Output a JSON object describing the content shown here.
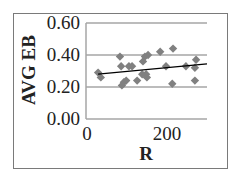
{
  "chart_data": {
    "type": "scatter",
    "title": "",
    "xlabel": "R",
    "ylabel": "AVG EB",
    "xlim": [
      0,
      310
    ],
    "ylim": [
      0.0,
      0.6
    ],
    "x_ticks": [
      0,
      200
    ],
    "x_tick_labels": [
      "0",
      "200"
    ],
    "y_ticks": [
      0.0,
      0.2,
      0.4,
      0.6
    ],
    "y_tick_labels": [
      "0.00",
      "0.20",
      "0.40",
      "0.60"
    ],
    "grid": {
      "horizontal": true,
      "vertical": false
    },
    "legend": null,
    "series": [
      {
        "name": "AVG EB",
        "marker": "diamond",
        "color": "#808080",
        "points": [
          {
            "x": 31,
            "y": 0.29
          },
          {
            "x": 38,
            "y": 0.26
          },
          {
            "x": 87,
            "y": 0.39
          },
          {
            "x": 90,
            "y": 0.33
          },
          {
            "x": 92,
            "y": 0.21
          },
          {
            "x": 97,
            "y": 0.23
          },
          {
            "x": 103,
            "y": 0.24
          },
          {
            "x": 110,
            "y": 0.33
          },
          {
            "x": 118,
            "y": 0.33
          },
          {
            "x": 131,
            "y": 0.24
          },
          {
            "x": 144,
            "y": 0.28
          },
          {
            "x": 146,
            "y": 0.36
          },
          {
            "x": 151,
            "y": 0.39
          },
          {
            "x": 154,
            "y": 0.28
          },
          {
            "x": 156,
            "y": 0.26
          },
          {
            "x": 159,
            "y": 0.4
          },
          {
            "x": 190,
            "y": 0.42
          },
          {
            "x": 205,
            "y": 0.33
          },
          {
            "x": 221,
            "y": 0.22
          },
          {
            "x": 223,
            "y": 0.44
          },
          {
            "x": 256,
            "y": 0.33
          },
          {
            "x": 279,
            "y": 0.32
          },
          {
            "x": 279,
            "y": 0.24
          },
          {
            "x": 282,
            "y": 0.37
          }
        ]
      }
    ],
    "trendline": {
      "type": "linear",
      "color": "#000000",
      "x": [
        31,
        310
      ],
      "y": [
        0.28,
        0.345
      ]
    }
  },
  "colors": {
    "marker": "#808080",
    "gridline": "#a6a6a6",
    "axis": "#a6a6a6",
    "trendline": "#111111",
    "frame": "#7a7a7a",
    "text": "#222222"
  }
}
